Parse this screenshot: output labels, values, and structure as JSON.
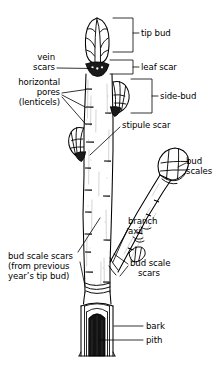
{
  "figure": {
    "background_color": "#ffffff",
    "ink_color": "#000000"
  },
  "labels": {
    "tip_bud": "tip bud",
    "leaf_scar": "leaf scar",
    "side_bud": "side-bud",
    "vein_scars": "vein\nscars",
    "lenticels": "horizontal\npores\n(lenticels)",
    "stipule_scar": "stipule scar",
    "bud_scales": "bud\nscales",
    "branch_axil": "branch\naxil",
    "bud_scale_scars_left": "bud scale scars\n(from previous\nyear’s tip bud)",
    "bud_scale_scars_right": "bud scale\n   scars",
    "bark": "bark",
    "pith": "pith"
  }
}
